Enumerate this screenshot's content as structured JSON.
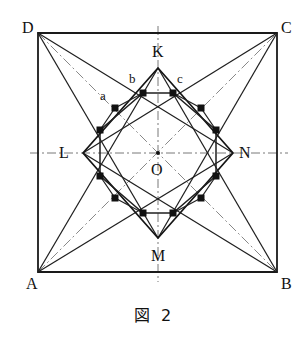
{
  "figure": {
    "caption": "図 2",
    "square": {
      "corners": [
        {
          "id": "A",
          "label": "A",
          "x": 38,
          "y": 272,
          "label_x": 26,
          "label_y": 276
        },
        {
          "id": "B",
          "label": "B",
          "x": 277,
          "y": 272,
          "label_x": 281,
          "label_y": 276
        },
        {
          "id": "C",
          "label": "C",
          "x": 277,
          "y": 33,
          "label_x": 281,
          "label_y": 20
        },
        {
          "id": "D",
          "label": "D",
          "x": 38,
          "y": 33,
          "label_x": 22,
          "label_y": 20
        }
      ]
    },
    "diamond": {
      "vertices": [
        {
          "id": "K",
          "label": "K",
          "x": 158,
          "y": 68,
          "label_x": 152,
          "label_y": 44
        },
        {
          "id": "L",
          "label": "L",
          "x": 83,
          "y": 153,
          "label_x": 59,
          "label_y": 145
        },
        {
          "id": "M",
          "label": "M",
          "x": 158,
          "y": 238,
          "label_x": 151,
          "label_y": 248
        },
        {
          "id": "N",
          "label": "N",
          "x": 233,
          "y": 153,
          "label_x": 239,
          "label_y": 145
        }
      ]
    },
    "center": {
      "id": "O",
      "label": "O",
      "x": 158,
      "y": 153,
      "label_x": 151,
      "label_y": 162
    },
    "marked_points": [
      {
        "id": "a",
        "label": "a",
        "x": 115,
        "y": 108,
        "label_x": 100,
        "label_y": 89
      },
      {
        "id": "b",
        "label": "b",
        "x": 143,
        "y": 93,
        "label_x": 129,
        "label_y": 72
      },
      {
        "id": "c",
        "label": "c",
        "x": 173,
        "y": 93,
        "label_x": 177,
        "label_y": 72
      }
    ],
    "dots": [
      {
        "x": 115,
        "y": 108
      },
      {
        "x": 143,
        "y": 93
      },
      {
        "x": 173,
        "y": 93
      },
      {
        "x": 201,
        "y": 108
      },
      {
        "x": 100,
        "y": 130
      },
      {
        "x": 216,
        "y": 130
      },
      {
        "x": 100,
        "y": 176
      },
      {
        "x": 216,
        "y": 176
      },
      {
        "x": 115,
        "y": 198
      },
      {
        "x": 143,
        "y": 213
      },
      {
        "x": 173,
        "y": 213
      },
      {
        "x": 201,
        "y": 198
      }
    ],
    "styles": {
      "stroke_dark": "#1a1a1a",
      "stroke_medium": "#2b2b2b",
      "stroke_light": "#555555",
      "dot_fill": "#111111",
      "background": "#ffffff"
    }
  }
}
